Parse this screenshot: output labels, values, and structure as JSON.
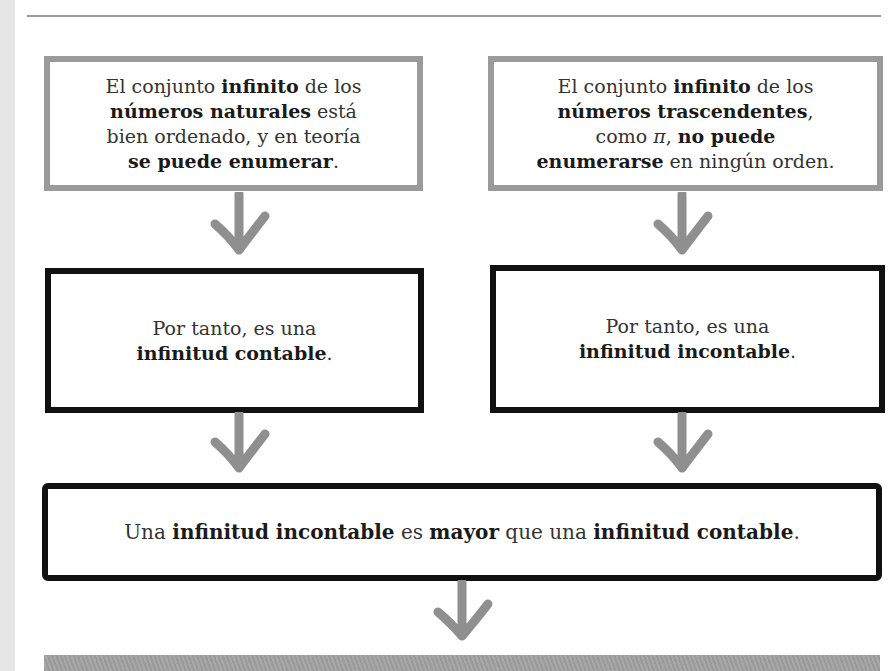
{
  "colors": {
    "grey_border": "#9b9b9b",
    "black_border": "#111111",
    "arrow": "#8f8f8f",
    "band": "#a0a0a0"
  },
  "top_left_box": {
    "l1_a": "El conjunto ",
    "l1_b": "infinito",
    "l1_c": " de los",
    "l2_a": "números naturales",
    "l2_b": " está",
    "l3": "bien ordenado, y en teoría",
    "l4_a": "se puede enumerar",
    "l4_b": "."
  },
  "top_right_box": {
    "l1_a": "El conjunto ",
    "l1_b": "infinito",
    "l1_c": " de los",
    "l2_a": "números trascendentes",
    "l2_b": ",",
    "l3_a": "como ",
    "l3_pi": "π",
    "l3_b": ", ",
    "l3_c": "no puede",
    "l4_a": "enumerarse",
    "l4_b": " en ningún orden."
  },
  "mid_left_box": {
    "l1": "Por tanto, es una",
    "l2_a": "infinitud contable",
    "l2_b": "."
  },
  "mid_right_box": {
    "l1": "Por tanto, es una",
    "l2_a": "infinitud incontable",
    "l2_b": "."
  },
  "bottom_box": {
    "a": "Una ",
    "b": "infinitud incontable",
    "c": " es ",
    "d": "mayor",
    "e": " que una ",
    "f": "infinitud contable",
    "g": "."
  },
  "arrows": [
    "arrow-down",
    "arrow-down",
    "arrow-down",
    "arrow-down",
    "arrow-down"
  ]
}
